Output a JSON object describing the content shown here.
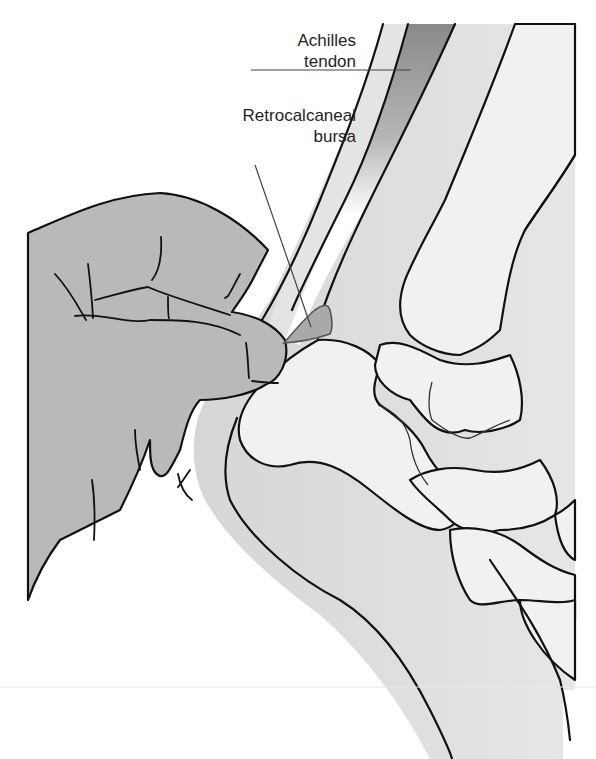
{
  "diagram": {
    "labels": [
      {
        "id": "achilles",
        "lines": [
          "Achilles",
          "tendon"
        ]
      },
      {
        "id": "bursa",
        "lines": [
          "Retrocalcaneal",
          "bursa"
        ]
      }
    ],
    "colors": {
      "hand": "#b8b8b8",
      "skin": "#dcdcdc",
      "bone": "#f0f0f0",
      "tendon_dark": "#8c8c8c",
      "bursa": "#a8a8a8",
      "outline": "#1a1a1a",
      "leader": "#444444"
    }
  }
}
